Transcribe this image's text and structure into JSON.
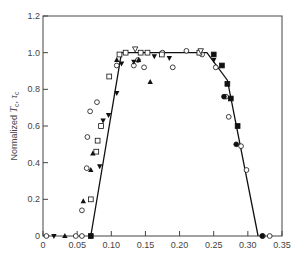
{
  "chart_data": {
    "type": "scatter",
    "title": "",
    "xlabel": "",
    "ylabel": "Normalized T_c, τ_c",
    "ylabel_parts": {
      "prefix": "Normalized ",
      "sym1": "T",
      "sub1": "c",
      "sep": ", ",
      "sym2": "τ",
      "sub2": "c"
    },
    "xlim": [
      0,
      0.35
    ],
    "ylim": [
      0,
      1.2
    ],
    "x_ticks": [
      0,
      0.05,
      0.1,
      0.15,
      0.2,
      0.25,
      0.3,
      0.35
    ],
    "x_tick_labels": [
      "0",
      "0.05",
      "0.10",
      "0.15",
      "0.20",
      "0.25",
      "0.30",
      "0.35"
    ],
    "y_ticks": [
      0,
      0.2,
      0.4,
      0.6,
      0.8,
      1.0,
      1.2
    ],
    "y_tick_labels": [
      "0",
      "0.2",
      "0.4",
      "0.6",
      "0.8",
      "1.0",
      "1.2"
    ],
    "grid": false,
    "legend": null,
    "fit_line": {
      "name": "trapezoid fit",
      "x": [
        0.07,
        0.115,
        0.24,
        0.27,
        0.315
      ],
      "y": [
        0.0,
        1.0,
        1.0,
        0.85,
        0.0
      ]
    },
    "series": [
      {
        "name": "open circle",
        "marker": "circle-open",
        "points": [
          [
            0.005,
            0.0
          ],
          [
            0.048,
            0.0
          ],
          [
            0.057,
            0.0
          ],
          [
            0.057,
            0.14
          ],
          [
            0.064,
            0.37
          ],
          [
            0.065,
            0.54
          ],
          [
            0.069,
            0.68
          ],
          [
            0.079,
            0.73
          ],
          [
            0.108,
            0.93
          ],
          [
            0.133,
            0.93
          ],
          [
            0.139,
            0.96
          ],
          [
            0.148,
            0.92
          ],
          [
            0.175,
            1.0
          ],
          [
            0.19,
            0.92
          ],
          [
            0.21,
            1.01
          ],
          [
            0.233,
            0.99
          ],
          [
            0.253,
            0.92
          ],
          [
            0.268,
            0.76
          ],
          [
            0.272,
            0.65
          ],
          [
            0.29,
            0.49
          ],
          [
            0.298,
            0.36
          ],
          [
            0.322,
            0.0
          ],
          [
            0.332,
            0.0
          ]
        ]
      },
      {
        "name": "open square",
        "marker": "square-open",
        "points": [
          [
            0.07,
            0.2
          ],
          [
            0.078,
            0.46
          ],
          [
            0.08,
            0.52
          ],
          [
            0.085,
            0.6
          ],
          [
            0.097,
            0.87
          ],
          [
            0.112,
            0.99
          ],
          [
            0.121,
            1.0
          ],
          [
            0.143,
            1.0
          ],
          [
            0.153,
            1.0
          ],
          [
            0.174,
            0.99
          ],
          [
            0.229,
            1.0
          ]
        ]
      },
      {
        "name": "filled circle",
        "marker": "circle-filled",
        "points": [
          [
            0.265,
            0.76
          ],
          [
            0.283,
            0.5
          ],
          [
            0.321,
            0.0
          ]
        ]
      },
      {
        "name": "filled square",
        "marker": "square-filled",
        "points": [
          [
            0.07,
            0.0
          ],
          [
            0.25,
            0.99
          ],
          [
            0.262,
            0.93
          ],
          [
            0.27,
            0.83
          ],
          [
            0.275,
            0.75
          ],
          [
            0.285,
            0.6
          ]
        ]
      },
      {
        "name": "filled triangle up",
        "marker": "triangle-up",
        "points": [
          [
            0.032,
            0.0
          ],
          [
            0.059,
            0.19
          ],
          [
            0.07,
            0.36
          ],
          [
            0.073,
            0.45
          ],
          [
            0.108,
            0.96
          ],
          [
            0.14,
            0.96
          ],
          [
            0.157,
            0.84
          ]
        ]
      },
      {
        "name": "filled triangle down",
        "marker": "triangle-down",
        "points": [
          [
            0.016,
            0.0
          ],
          [
            0.07,
            0.0
          ],
          [
            0.083,
            0.38
          ],
          [
            0.088,
            0.63
          ],
          [
            0.096,
            0.66
          ],
          [
            0.108,
            0.78
          ],
          [
            0.115,
            0.94
          ],
          [
            0.133,
            0.95
          ],
          [
            0.163,
            0.98
          ],
          [
            0.185,
            0.97
          ],
          [
            0.25,
            0.96
          ]
        ]
      },
      {
        "name": "open triangle down",
        "marker": "triangle-down-open",
        "points": [
          [
            0.135,
            1.02
          ],
          [
            0.231,
            1.01
          ]
        ]
      }
    ]
  },
  "layout": {
    "plot_area": {
      "left": 43,
      "top": 16,
      "right": 282,
      "bottom": 236
    },
    "colors": {
      "axis": "#444444",
      "line": "#111111",
      "marker": "#111111",
      "background": "#ffffff"
    }
  }
}
